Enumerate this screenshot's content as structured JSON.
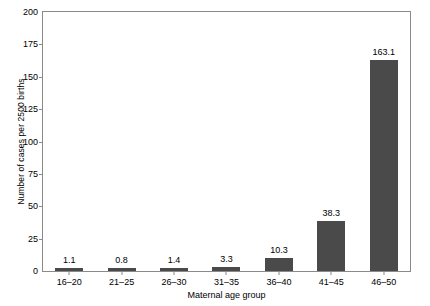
{
  "chart_data": {
    "type": "bar",
    "title": "",
    "subtitle": "",
    "xlabel": "Maternal age group",
    "ylabel": "Number of cases per 2500 births",
    "categories": [
      "16–20",
      "21–25",
      "26–30",
      "31–35",
      "36–40",
      "41–45",
      "46–50"
    ],
    "values": [
      1.1,
      0.8,
      1.4,
      3.3,
      10.3,
      38.3,
      163.1
    ],
    "value_labels": [
      "1.1",
      "0.8",
      "1.4",
      "3.3",
      "10.3",
      "38.3",
      "163.1"
    ],
    "ylim": [
      0,
      200
    ],
    "yticks": [
      0,
      25,
      50,
      75,
      100,
      125,
      150,
      175,
      200
    ],
    "ytick_labels": [
      "0",
      "25",
      "50",
      "75",
      "100",
      "125",
      "150",
      "175",
      "200"
    ],
    "grid": false,
    "legend": null,
    "bar_color": "#4a4a4a",
    "axis_color": "#8a8a8a",
    "background_color": "#ffffff"
  }
}
